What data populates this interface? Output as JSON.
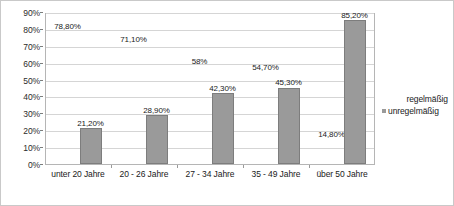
{
  "chart_data": {
    "type": "bar",
    "title": "",
    "subtitle": "",
    "xlabel": "",
    "ylabel": "",
    "categories": [
      "unter 20 Jahre",
      "20 - 26 Jahre",
      "27 - 34 Jahre",
      "35 - 49 Jahre",
      "über 50 Jahre"
    ],
    "series": [
      {
        "name": "regelmäßig",
        "values": [
          78.8,
          71.1,
          58.0,
          54.7,
          14.8
        ],
        "labels": [
          "78,80%",
          "71,10%",
          "58%",
          "54,70%",
          "14,80%"
        ],
        "color": "#ffffff",
        "visible_bars": false
      },
      {
        "name": "unregelmäßig",
        "values": [
          21.2,
          28.9,
          42.3,
          45.3,
          85.2
        ],
        "labels": [
          "21,20%",
          "28,90%",
          "42,30%",
          "45,30%",
          "85,20%"
        ],
        "color": "#9a9a9a",
        "visible_bars": true
      }
    ],
    "ylim": [
      0,
      90
    ],
    "ytick_values": [
      0,
      10,
      20,
      30,
      40,
      50,
      60,
      70,
      80,
      90
    ],
    "ytick_labels": [
      "0%",
      "10%",
      "20%",
      "30%",
      "40%",
      "50%",
      "60%",
      "70%",
      "80%",
      "90%"
    ],
    "grid": true,
    "legend_position": "right"
  },
  "legend": {
    "items": [
      {
        "label": "regelmäßig",
        "swatch": "white-square-marker"
      },
      {
        "label": "unregelmäßig",
        "swatch": "gray-square-marker"
      }
    ]
  }
}
